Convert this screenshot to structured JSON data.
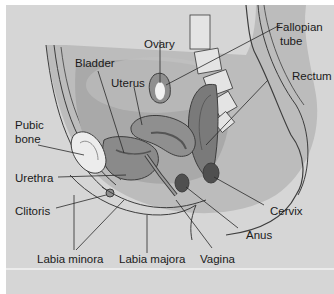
{
  "figure": {
    "colors": {
      "background": "#d6d6d6",
      "body": "#b9b9b9",
      "pelvic_cavity": "#a8a8a8",
      "organ": "#8f8f8f",
      "organ_dark": "#6e6e6e",
      "bone": "#ebebeb",
      "outline": "#3d3d3d"
    },
    "labels": {
      "ovary": "Ovary",
      "fallopian_tube_line1": "Fallopian",
      "fallopian_tube_line2": "tube",
      "bladder": "Bladder",
      "uterus": "Uterus",
      "rectum": "Rectum",
      "pubic_bone_line1": "Pubic",
      "pubic_bone_line2": "bone",
      "urethra": "Urethra",
      "clitoris": "Clitoris",
      "cervix": "Cervix",
      "anus": "Anus",
      "labia_minora": "Labia minora",
      "labia_majora": "Labia majora",
      "vagina": "Vagina"
    }
  }
}
